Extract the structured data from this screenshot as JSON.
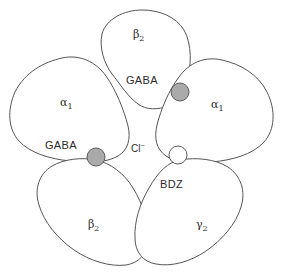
{
  "figure": {
    "width": 285,
    "height": 274,
    "background_color": "#ffffff"
  },
  "colors": {
    "outline": "#555555",
    "petal_fill": "#ffffff",
    "binding_site_filled": "#aaaaaa",
    "binding_site_open": "#ffffff",
    "binding_site_stroke": "#5a5a5a",
    "text": "#2b2b2b"
  },
  "subunits": [
    {
      "id": "beta-top",
      "greek": "β",
      "subscript": "2",
      "label": "β₂",
      "position": "top"
    },
    {
      "id": "alpha-left",
      "greek": "α",
      "subscript": "1",
      "label": "α₁",
      "position": "left"
    },
    {
      "id": "alpha-right",
      "greek": "α",
      "subscript": "1",
      "label": "α₁",
      "position": "right"
    },
    {
      "id": "beta-bottom",
      "greek": "β",
      "subscript": "2",
      "label": "β₂",
      "position": "bottom-left"
    },
    {
      "id": "gamma-bottom",
      "greek": "γ",
      "subscript": "2",
      "label": "γ₂",
      "position": "bottom-right"
    }
  ],
  "binding_sites": [
    {
      "id": "gaba-top",
      "label": "GABA",
      "style": "filled",
      "between": "beta-top / alpha-right"
    },
    {
      "id": "gaba-left",
      "label": "GABA",
      "style": "filled",
      "between": "alpha-left / beta-bottom"
    },
    {
      "id": "bdz",
      "label": "BDZ",
      "style": "open",
      "between": "alpha-right / gamma-bottom"
    }
  ],
  "pore": {
    "ion": "Cl",
    "charge": "−",
    "label": "Cl⁻"
  }
}
